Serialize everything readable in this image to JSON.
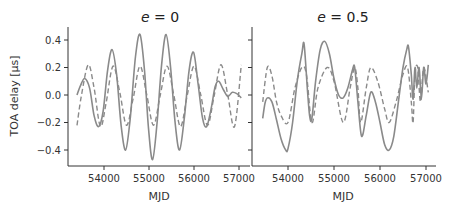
{
  "chart_data": [
    {
      "type": "line",
      "title": "e = 0",
      "title_var": "e",
      "title_value": "0",
      "xlabel": "MJD",
      "ylabel": "TOA delay [μs]",
      "xlim": [
        53300,
        57200
      ],
      "ylim": [
        -0.5,
        0.5
      ],
      "xticks": [
        54000,
        55000,
        56000,
        57000
      ],
      "yticks": [
        0.4,
        0.2,
        0.0,
        -0.2,
        -0.4
      ],
      "ytick_labels": [
        "0.4",
        "0.2",
        "0.0",
        "−0.2",
        "−0.4"
      ],
      "grid": false,
      "series": [
        {
          "name": "solid",
          "style": "solid",
          "x": [
            53400,
            53480,
            53570,
            53680,
            53780,
            53880,
            53980,
            54080,
            54180,
            54280,
            54380,
            54480,
            54580,
            54700,
            54800,
            54900,
            54990,
            55080,
            55180,
            55280,
            55380,
            55480,
            55580,
            55680,
            55790,
            55890,
            55990,
            56090,
            56190,
            56280,
            56380,
            56470,
            56550,
            56650,
            56750,
            56850,
            56950,
            57050
          ],
          "y": [
            0.0,
            0.07,
            0.12,
            0.05,
            -0.15,
            -0.23,
            -0.12,
            0.18,
            0.33,
            0.15,
            -0.22,
            -0.4,
            -0.18,
            0.28,
            0.44,
            0.18,
            -0.25,
            -0.47,
            -0.2,
            0.22,
            0.44,
            0.2,
            -0.2,
            -0.4,
            -0.15,
            0.18,
            0.31,
            0.08,
            -0.17,
            -0.23,
            -0.1,
            0.06,
            0.1,
            0.04,
            -0.01,
            0.02,
            0.01,
            -0.02
          ]
        },
        {
          "name": "dashed",
          "style": "dashed",
          "x": [
            53400,
            53500,
            53650,
            53780,
            53920,
            54050,
            54200,
            54350,
            54500,
            54650,
            54800,
            54950,
            55100,
            55250,
            55400,
            55550,
            55700,
            55850,
            56000,
            56150,
            56300,
            56450,
            56600,
            56750,
            56900,
            57050
          ],
          "y": [
            -0.22,
            0.0,
            0.22,
            0.05,
            -0.23,
            -0.05,
            0.21,
            0.02,
            -0.22,
            -0.02,
            0.21,
            0.0,
            -0.22,
            0.0,
            0.21,
            0.0,
            -0.23,
            0.0,
            0.21,
            0.0,
            -0.22,
            0.0,
            0.22,
            0.0,
            -0.23,
            0.22
          ]
        }
      ]
    },
    {
      "type": "line",
      "title": "e = 0.5",
      "title_var": "e",
      "title_value": "0.5",
      "xlabel": "MJD",
      "ylabel": "",
      "xlim": [
        53300,
        57200
      ],
      "ylim": [
        -0.5,
        0.5
      ],
      "xticks": [
        54000,
        55000,
        56000,
        57000
      ],
      "yticks": [
        0.4,
        0.2,
        0.0,
        -0.2,
        -0.4
      ],
      "grid": false,
      "sharey": true,
      "series": [
        {
          "name": "solid",
          "style": "solid",
          "x": [
            53450,
            53500,
            53560,
            53650,
            53750,
            53850,
            53950,
            54000,
            54100,
            54200,
            54300,
            54350,
            54420,
            54470,
            54520,
            54600,
            54700,
            54800,
            54900,
            55000,
            55100,
            55200,
            55300,
            55400,
            55450,
            55520,
            55600,
            55700,
            55800,
            55900,
            56000,
            56100,
            56200,
            56300,
            56400,
            56500,
            56580,
            56620,
            56680,
            56720,
            56760,
            56800,
            56850,
            56900,
            56950,
            57000,
            57050
          ],
          "y": [
            -0.17,
            -0.06,
            -0.02,
            -0.05,
            -0.18,
            -0.32,
            -0.4,
            -0.39,
            -0.2,
            0.1,
            0.3,
            0.37,
            0.05,
            -0.15,
            -0.17,
            0.1,
            0.33,
            0.39,
            0.3,
            0.12,
            0.0,
            -0.02,
            0.05,
            0.18,
            0.2,
            -0.05,
            -0.3,
            -0.15,
            0.02,
            -0.05,
            -0.2,
            -0.36,
            -0.4,
            -0.3,
            -0.05,
            0.2,
            0.33,
            0.35,
            0.15,
            -0.03,
            0.2,
            0.05,
            0.2,
            -0.03,
            0.2,
            0.08,
            0.22
          ]
        },
        {
          "name": "dashed",
          "style": "dashed",
          "x": [
            53450,
            53550,
            53650,
            53750,
            53850,
            54000,
            54150,
            54300,
            54400,
            54520,
            54650,
            54850,
            55000,
            55200,
            55350,
            55450,
            55520,
            55580,
            55700,
            55800,
            55950,
            56100,
            56200,
            56350,
            56500,
            56600,
            56680,
            56720,
            56760,
            56820,
            56880,
            56950,
            57050
          ],
          "y": [
            -0.05,
            0.2,
            0.14,
            -0.05,
            -0.15,
            -0.2,
            0.05,
            0.2,
            0.15,
            -0.2,
            0.05,
            0.2,
            0.1,
            -0.2,
            0.05,
            0.2,
            0.05,
            -0.2,
            0.05,
            0.2,
            0.1,
            -0.1,
            -0.2,
            -0.05,
            0.15,
            0.2,
            -0.05,
            -0.2,
            0.15,
            0.2,
            -0.05,
            0.2,
            0.02
          ]
        }
      ]
    }
  ],
  "colors": {
    "line": "#8a8a8a",
    "axis": "#333333",
    "text": "#333333"
  }
}
